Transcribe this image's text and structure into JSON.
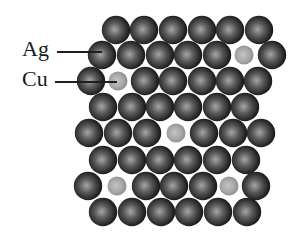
{
  "diagram": {
    "labels": {
      "ag": {
        "text": "Ag",
        "x": 22,
        "y": 38,
        "line_x1": 57,
        "line_x2": 102,
        "line_y": 52
      },
      "cu": {
        "text": "Cu",
        "x": 22,
        "y": 68,
        "line_x1": 55,
        "line_x2": 117,
        "line_y": 82
      }
    },
    "atom_styles": {
      "Ag": {
        "radius": 14.2,
        "highlight": "#a6a6a6",
        "mid": "#5a5a5a",
        "edge": "#141414"
      },
      "Cu": {
        "radius": 9.5,
        "highlight": "#c4c4c4",
        "mid": "#a9a9a9",
        "edge": "#8c8c8c"
      }
    },
    "rows": [
      {
        "y": 30,
        "atoms": [
          {
            "x": 116,
            "el": "Ag"
          },
          {
            "x": 144,
            "el": "Ag"
          },
          {
            "x": 173,
            "el": "Ag"
          },
          {
            "x": 202,
            "el": "Ag"
          },
          {
            "x": 230,
            "el": "Ag"
          },
          {
            "x": 259,
            "el": "Ag"
          }
        ]
      },
      {
        "y": 55,
        "atoms": [
          {
            "x": 102,
            "el": "Ag"
          },
          {
            "x": 131,
            "el": "Ag"
          },
          {
            "x": 160,
            "el": "Ag"
          },
          {
            "x": 188,
            "el": "Ag"
          },
          {
            "x": 217,
            "el": "Ag"
          },
          {
            "x": 244,
            "el": "Cu"
          },
          {
            "x": 272,
            "el": "Ag"
          }
        ]
      },
      {
        "y": 81,
        "atoms": [
          {
            "x": 91,
            "el": "Ag"
          },
          {
            "x": 118,
            "el": "Cu"
          },
          {
            "x": 145,
            "el": "Ag"
          },
          {
            "x": 173,
            "el": "Ag"
          },
          {
            "x": 202,
            "el": "Ag"
          },
          {
            "x": 230,
            "el": "Ag"
          },
          {
            "x": 258,
            "el": "Ag"
          }
        ]
      },
      {
        "y": 107,
        "atoms": [
          {
            "x": 103,
            "el": "Ag"
          },
          {
            "x": 132,
            "el": "Ag"
          },
          {
            "x": 160,
            "el": "Ag"
          },
          {
            "x": 188,
            "el": "Ag"
          },
          {
            "x": 217,
            "el": "Ag"
          },
          {
            "x": 245,
            "el": "Ag"
          }
        ]
      },
      {
        "y": 133,
        "atoms": [
          {
            "x": 89,
            "el": "Ag"
          },
          {
            "x": 118,
            "el": "Ag"
          },
          {
            "x": 147,
            "el": "Ag"
          },
          {
            "x": 176,
            "el": "Cu"
          },
          {
            "x": 204,
            "el": "Ag"
          },
          {
            "x": 233,
            "el": "Ag"
          },
          {
            "x": 261,
            "el": "Ag"
          }
        ]
      },
      {
        "y": 160,
        "atoms": [
          {
            "x": 103,
            "el": "Ag"
          },
          {
            "x": 132,
            "el": "Ag"
          },
          {
            "x": 160,
            "el": "Ag"
          },
          {
            "x": 188,
            "el": "Ag"
          },
          {
            "x": 217,
            "el": "Ag"
          },
          {
            "x": 246,
            "el": "Ag"
          }
        ]
      },
      {
        "y": 186,
        "atoms": [
          {
            "x": 88,
            "el": "Ag"
          },
          {
            "x": 117,
            "el": "Cu"
          },
          {
            "x": 146,
            "el": "Ag"
          },
          {
            "x": 174,
            "el": "Ag"
          },
          {
            "x": 203,
            "el": "Ag"
          },
          {
            "x": 229,
            "el": "Cu"
          },
          {
            "x": 256,
            "el": "Ag"
          }
        ]
      },
      {
        "y": 212,
        "atoms": [
          {
            "x": 103,
            "el": "Ag"
          },
          {
            "x": 132,
            "el": "Ag"
          },
          {
            "x": 161,
            "el": "Ag"
          },
          {
            "x": 189,
            "el": "Ag"
          },
          {
            "x": 218,
            "el": "Ag"
          },
          {
            "x": 247,
            "el": "Ag"
          }
        ]
      }
    ]
  }
}
